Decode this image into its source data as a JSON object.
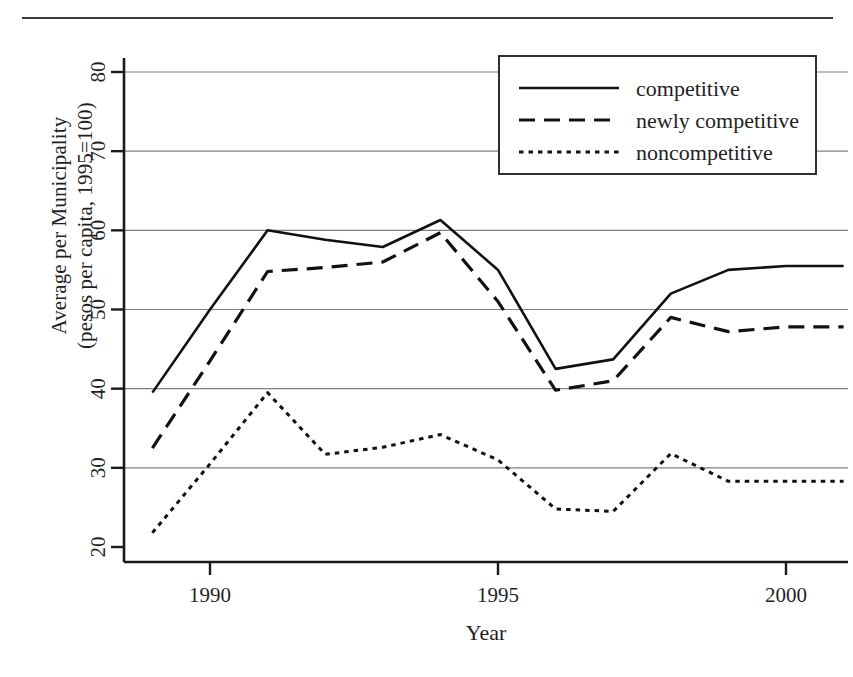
{
  "figure": {
    "has_top_rule": true
  },
  "chart_data": {
    "type": "line",
    "title": "",
    "xlabel": "Year",
    "ylabel": "Average per Municipality (pesos per capita, 1995=100)",
    "ylabel_line1": "Average per Municipality",
    "ylabel_line2": "(pesos per capita, 1995=100)",
    "x": [
      1989,
      1990,
      1991,
      1992,
      1993,
      1994,
      1995,
      1996,
      1997,
      1998,
      1999,
      2000,
      2001
    ],
    "xlim": [
      1988.7,
      2001.3
    ],
    "ylim": [
      20,
      82
    ],
    "xticks": [
      1990,
      1995,
      2000
    ],
    "xtick_labels": [
      "1990",
      "1995",
      "2000"
    ],
    "yticks": [
      20,
      30,
      40,
      50,
      60,
      70,
      80
    ],
    "ytick_labels": [
      "20",
      "30",
      "40",
      "50",
      "60",
      "70",
      "80"
    ],
    "gridlines": [
      30,
      40,
      50,
      60,
      70,
      80
    ],
    "grid": true,
    "legend_position": "top-right",
    "series": [
      {
        "name": "competitive",
        "style": "solid",
        "color": "#111111",
        "values": [
          39.5,
          50.0,
          60.0,
          58.8,
          57.9,
          61.3,
          55.0,
          42.5,
          43.7,
          52.0,
          55.0,
          55.5,
          55.5
        ]
      },
      {
        "name": "newly competitive",
        "style": "dashed",
        "color": "#111111",
        "values": [
          32.5,
          43.5,
          54.8,
          55.3,
          56.0,
          59.7,
          51.0,
          39.8,
          41.0,
          49.0,
          47.2,
          47.8,
          47.8
        ]
      },
      {
        "name": "noncompetitive",
        "style": "dotted",
        "color": "#111111",
        "values": [
          21.8,
          30.5,
          39.5,
          31.7,
          32.6,
          34.2,
          31.0,
          24.8,
          24.5,
          31.8,
          28.3,
          28.3,
          28.3
        ]
      }
    ]
  },
  "legend": {
    "entries": [
      {
        "label": "competitive",
        "style": "solid"
      },
      {
        "label": "newly competitive",
        "style": "dashed"
      },
      {
        "label": "noncompetitive",
        "style": "dotted"
      }
    ]
  }
}
